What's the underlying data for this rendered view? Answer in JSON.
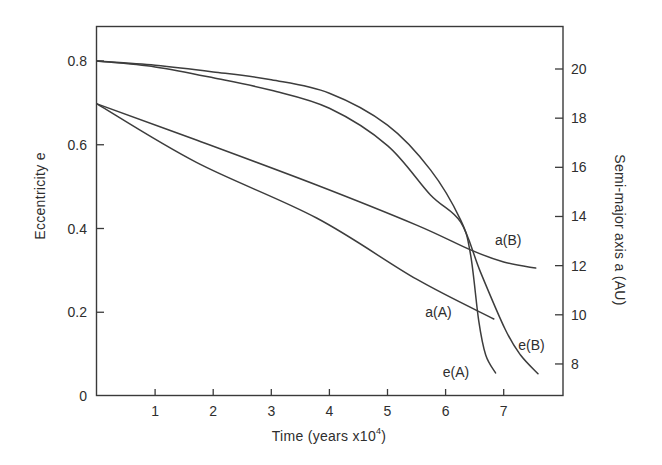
{
  "chart_data": {
    "type": "line",
    "title": "",
    "xlabel": "Time (years x10^4)",
    "xlabel_main": "Time (years x10",
    "xlabel_exp": "4",
    "xlabel_close": ")",
    "ylabel_left": "Eccentricity e",
    "ylabel_right": "Semi-major axis a (AU)",
    "xlim": [
      0,
      8
    ],
    "ylim_left": [
      0,
      0.88
    ],
    "ylim_right": [
      7.0,
      21.4
    ],
    "x_ticks": [
      1,
      2,
      3,
      4,
      5,
      6,
      7
    ],
    "x_tick_labels": [
      "1",
      "2",
      "3",
      "4",
      "5",
      "6",
      "7"
    ],
    "left_ticks": [
      0,
      0.2,
      0.4,
      0.6,
      0.8
    ],
    "left_tick_labels": [
      "0",
      "0.2",
      "0.4",
      "0.6",
      "0.8"
    ],
    "right_ticks": [
      8,
      10,
      12,
      14,
      16,
      18,
      20
    ],
    "right_tick_labels": [
      "8",
      "10",
      "12",
      "14",
      "16",
      "18",
      "20"
    ],
    "grid": false,
    "legend": "inline curve labels",
    "series": [
      {
        "name": "e(A)",
        "axis": "left",
        "x": [
          0,
          1.0,
          2.0,
          3.0,
          4.0,
          5.0,
          5.74,
          6.26,
          6.43,
          6.57,
          6.69,
          6.86
        ],
        "y": [
          0.8,
          0.79,
          0.774,
          0.755,
          0.723,
          0.647,
          0.54,
          0.42,
          0.337,
          0.18,
          0.098,
          0.055
        ],
        "label_pos": [
          5.95,
          0.045
        ]
      },
      {
        "name": "e(B)",
        "axis": "left",
        "x": [
          0,
          1.0,
          2.0,
          3.0,
          4.0,
          5.0,
          5.74,
          6.26,
          6.6,
          7.03,
          7.29,
          7.59
        ],
        "y": [
          0.8,
          0.786,
          0.76,
          0.73,
          0.687,
          0.598,
          0.48,
          0.415,
          0.296,
          0.158,
          0.098,
          0.053
        ],
        "label_pos": [
          7.25,
          0.11
        ]
      },
      {
        "name": "a(A)",
        "axis": "right",
        "x": [
          0,
          1.71,
          3.78,
          5.5,
          6.83
        ],
        "y": [
          18.58,
          16.2,
          13.94,
          11.45,
          9.83
        ],
        "label_pos": [
          5.65,
          9.9
        ]
      },
      {
        "name": "a(B)",
        "axis": "right",
        "x": [
          0,
          1.71,
          3.78,
          5.5,
          6.43,
          7.0,
          7.55
        ],
        "y": [
          18.58,
          17.11,
          15.28,
          13.65,
          12.64,
          12.15,
          11.9
        ],
        "label_pos": [
          6.85,
          12.85
        ]
      }
    ]
  },
  "labels": {
    "xlabel_main": "Time (years x10",
    "xlabel_exp": "4",
    "xlabel_close": ")",
    "ylabel_left": "Eccentricity e",
    "ylabel_right": "Semi-major axis a (AU)"
  }
}
